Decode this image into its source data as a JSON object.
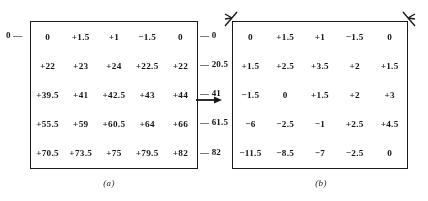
{
  "figure": {
    "panel_a": {
      "caption": "(a)",
      "left_scale": [
        "0"
      ],
      "right_scale": [
        "0",
        "20.5",
        "41",
        "61.5",
        "82"
      ],
      "matrix": [
        [
          "0",
          "+1.5",
          "+1",
          "−1.5",
          "0"
        ],
        [
          "+22",
          "+23",
          "+24",
          "+22.5",
          "+22"
        ],
        [
          "+39.5",
          "+41",
          "+42.5",
          "+43",
          "+44"
        ],
        [
          "+55.5",
          "+59",
          "+60.5",
          "+64",
          "+66"
        ],
        [
          "+70.5",
          "+73.5",
          "+75",
          "+79.5",
          "+82"
        ]
      ]
    },
    "panel_b": {
      "caption": "(b)",
      "matrix": [
        [
          "0",
          "+1.5",
          "+1",
          "−1.5",
          "0"
        ],
        [
          "+1.5",
          "+2.5",
          "+3.5",
          "+2",
          "+1.5"
        ],
        [
          "−1.5",
          "0",
          "+1.5",
          "+2",
          "+3"
        ],
        [
          "−6",
          "−2.5",
          "−1",
          "+2.5",
          "+4.5"
        ],
        [
          "−11.5",
          "−8.5",
          "−7",
          "−2.5",
          "0"
        ]
      ]
    },
    "marks": {
      "corner_top_left": "slash-arrow-mark",
      "corner_top_right": "slash-arrow-mark",
      "connector": "right-arrow"
    },
    "colors": {
      "ink": "#1a1a1a",
      "paper": "#fefefe",
      "border": "#1d1d1d"
    }
  }
}
